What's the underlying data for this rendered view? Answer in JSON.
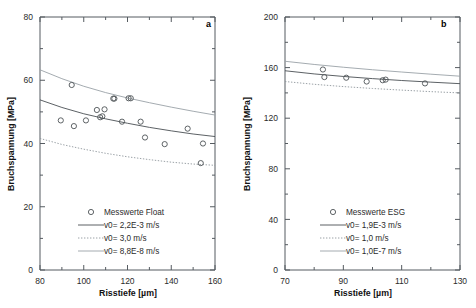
{
  "figure": {
    "panels": [
      {
        "letter": "a",
        "xlabel": "Risstiefe [µm]",
        "ylabel": "Bruchspannung [MPa]",
        "xticks": [
          80,
          100,
          120,
          140,
          160
        ],
        "yticks": [
          0,
          20,
          40,
          60,
          80
        ],
        "legend": [
          {
            "label": "Messwerte Float",
            "marker": "circle"
          },
          {
            "label": "v0= 2,2E-3 m/s",
            "marker": "solid"
          },
          {
            "label": "v0= 3,0 m/s",
            "marker": "dotted"
          },
          {
            "label": "v0= 8,8E-8 m/s",
            "marker": "light"
          }
        ]
      },
      {
        "letter": "b",
        "xlabel": "Risstiefe [µm]",
        "ylabel": "Bruchspannung [MPa]",
        "xticks": [
          70,
          90,
          110,
          130
        ],
        "yticks": [
          0,
          40,
          80,
          120,
          160,
          200
        ],
        "legend": [
          {
            "label": "Messwerte ESG",
            "marker": "circle"
          },
          {
            "label": "v0= 1,9E-3 m/s",
            "marker": "solid"
          },
          {
            "label": "v0= 1,0 m/s",
            "marker": "dotted"
          },
          {
            "label": "v0= 1,0E-7 m/s",
            "marker": "light"
          }
        ]
      }
    ]
  },
  "chart_data": [
    {
      "type": "scatter",
      "title": "a",
      "xlabel": "Risstiefe [µm]",
      "ylabel": "Bruchspannung [MPa]",
      "xlim": [
        80,
        160
      ],
      "ylim": [
        0,
        80
      ],
      "xticks": [
        80,
        100,
        120,
        140,
        160
      ],
      "yticks": [
        0,
        20,
        40,
        60,
        80
      ],
      "grid": false,
      "legend_position": "lower-center",
      "scatter": {
        "name": "Messwerte Float",
        "x": [
          89.5,
          94.5,
          95.5,
          101,
          106,
          107.5,
          108.5,
          109.5,
          113.5,
          114,
          117.5,
          120.5,
          121.5,
          126,
          128,
          137,
          147.5,
          153.5,
          154.5
        ],
        "y": [
          47.3,
          58.5,
          45.5,
          47.3,
          50.6,
          48.3,
          48.6,
          50.8,
          54.2,
          54.2,
          46.9,
          54.3,
          54.3,
          46.9,
          41.9,
          39.8,
          44.7,
          33.8,
          40.0
        ]
      },
      "series": [
        {
          "name": "v0= 2,2E-3 m/s",
          "style": "solid",
          "x": [
            80,
            90,
            100,
            110,
            120,
            130,
            140,
            150,
            160
          ],
          "y": [
            53.8,
            51.4,
            49.4,
            47.8,
            46.4,
            45.1,
            44.0,
            43.0,
            42.2
          ]
        },
        {
          "name": "v0= 3,0 m/s",
          "style": "dotted",
          "x": [
            80,
            90,
            100,
            110,
            120,
            130,
            140,
            150,
            160
          ],
          "y": [
            41.6,
            39.7,
            38.2,
            36.9,
            35.8,
            34.9,
            34.1,
            33.5,
            33.1
          ]
        },
        {
          "name": "v0= 8,8E-8 m/s",
          "style": "light",
          "x": [
            80,
            90,
            100,
            110,
            120,
            130,
            140,
            150,
            160
          ],
          "y": [
            63.3,
            60.5,
            58.1,
            56.1,
            54.4,
            52.9,
            51.5,
            50.2,
            49.0
          ]
        }
      ]
    },
    {
      "type": "scatter",
      "title": "b",
      "xlabel": "Risstiefe [µm]",
      "ylabel": "Bruchspannung [MPa]",
      "xlim": [
        70,
        130
      ],
      "ylim": [
        0,
        200
      ],
      "xticks": [
        70,
        90,
        110,
        130
      ],
      "yticks": [
        0,
        40,
        80,
        120,
        160,
        200
      ],
      "grid": false,
      "legend_position": "lower-center",
      "scatter": {
        "name": "Messwerte ESG",
        "x": [
          83,
          83.5,
          91,
          98,
          103.5,
          104.5,
          118
        ],
        "y": [
          158.5,
          152.5,
          152.0,
          149.0,
          150.0,
          150.5,
          147.5
        ]
      },
      "series": [
        {
          "name": "v0= 1,9E-3 m/s",
          "style": "solid",
          "x": [
            70,
            80,
            90,
            100,
            110,
            120,
            130
          ],
          "y": [
            157.5,
            155.0,
            153.0,
            151.3,
            149.8,
            148.5,
            147.3
          ]
        },
        {
          "name": "v0= 1,0 m/s",
          "style": "dotted",
          "x": [
            70,
            80,
            90,
            100,
            110,
            120,
            130
          ],
          "y": [
            149.0,
            146.8,
            145.0,
            143.5,
            142.2,
            141.0,
            140.0
          ]
        },
        {
          "name": "v0= 1,0E-7 m/s",
          "style": "light",
          "x": [
            70,
            80,
            90,
            100,
            110,
            120,
            130
          ],
          "y": [
            165.0,
            162.5,
            160.3,
            158.3,
            156.5,
            154.8,
            153.2
          ]
        }
      ]
    }
  ]
}
